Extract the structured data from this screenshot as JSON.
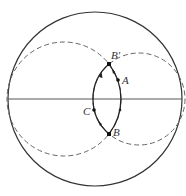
{
  "diagram": {
    "type": "geometry",
    "colors": {
      "stroke": "#333333",
      "dashed": "#666666",
      "point": "#111111"
    },
    "outer_circle": {
      "cx": 95,
      "cy": 99,
      "r": 87
    },
    "diameter": {
      "x1": 8,
      "y1": 99,
      "x2": 182,
      "y2": 99
    },
    "left_dashed_circle": {
      "cx": 64,
      "cy": 99,
      "r": 57
    },
    "right_dashed_circle": {
      "cx": 139,
      "cy": 99,
      "r": 46
    },
    "points": [
      {
        "id": "B_prime",
        "label": "B′",
        "x": 109,
        "y": 64
      },
      {
        "id": "A",
        "label": "A",
        "x": 118,
        "y": 80
      },
      {
        "id": "C",
        "label": "C",
        "x": 94,
        "y": 110
      },
      {
        "id": "B",
        "label": "B",
        "x": 109,
        "y": 134
      }
    ],
    "labels": {
      "B_prime": "B′",
      "A": "A",
      "C": "C",
      "B": "B"
    }
  }
}
